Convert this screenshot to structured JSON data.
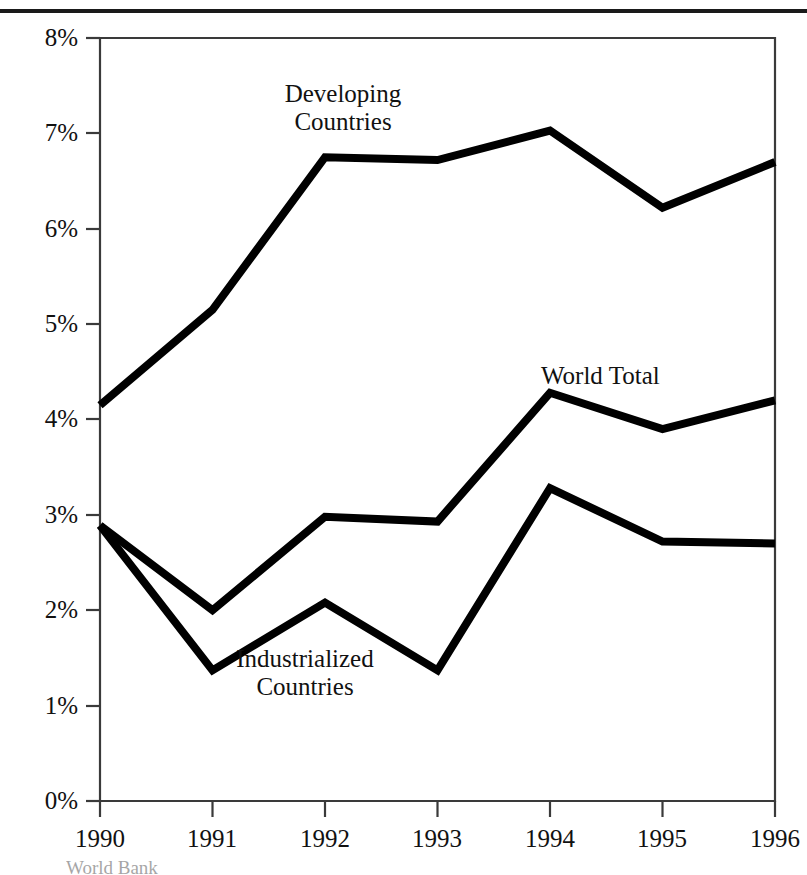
{
  "chart_data": {
    "type": "line",
    "title": "",
    "xlabel": "",
    "ylabel": "",
    "categories": [
      "1990",
      "1991",
      "1992",
      "1993",
      "1994",
      "1995",
      "1996"
    ],
    "x": [
      1990,
      1991,
      1992,
      1993,
      1994,
      1995,
      1996
    ],
    "xlim": [
      1990,
      1996
    ],
    "ylim": [
      0,
      8
    ],
    "ytick_labels": [
      "0%",
      "1%",
      "2%",
      "3%",
      "4%",
      "5%",
      "6%",
      "7%",
      "8%"
    ],
    "ytick_values": [
      0,
      1,
      2,
      3,
      4,
      5,
      6,
      7,
      8
    ],
    "grid": false,
    "legend_position": "inline-annotations",
    "units": "percent",
    "series": [
      {
        "name": "Developing Countries",
        "values": [
          4.15,
          5.15,
          6.75,
          6.72,
          7.03,
          6.22,
          6.7
        ],
        "color": "#000000",
        "label_x": 1992.05,
        "label_y": 7.52
      },
      {
        "name": "World Total",
        "values": [
          2.89,
          2.0,
          2.98,
          2.93,
          4.28,
          3.9,
          4.2
        ],
        "color": "#000000",
        "label_x": 1995.5,
        "label_y": 4.68
      },
      {
        "name": "Industrialized Countries",
        "values": [
          2.89,
          1.37,
          2.08,
          1.37,
          3.28,
          2.72,
          2.7
        ],
        "color": "#000000",
        "label_x": 1992.4,
        "label_y": 1.22
      }
    ],
    "annotations": [
      {
        "text": "Developing",
        "series": "Developing Countries"
      },
      {
        "text": "Countries",
        "series": "Developing Countries"
      },
      {
        "text": "World Total",
        "series": "World Total"
      },
      {
        "text": "Industrialized",
        "series": "Industrialized Countries"
      },
      {
        "text": "Countries",
        "series": "Industrialized Countries"
      }
    ]
  },
  "axis": {
    "y_labels": [
      "8%",
      "7%",
      "6%",
      "5%",
      "4%",
      "3%",
      "2%",
      "1%",
      "0%"
    ],
    "x_labels": [
      "1990",
      "1991",
      "1992",
      "1993",
      "1994",
      "1995",
      "1996"
    ]
  },
  "annotations": {
    "developing_line1": "Developing",
    "developing_line2": "Countries",
    "world_total": "World Total",
    "industrialized_line1": "Industrialized",
    "industrialized_line2": "Countries"
  },
  "source": {
    "note": "World Bank"
  },
  "colors": {
    "line": "#000000",
    "axis": "#3a3a3a",
    "rule": "#1a1a1a",
    "text": "#111111",
    "background": "#ffffff"
  }
}
